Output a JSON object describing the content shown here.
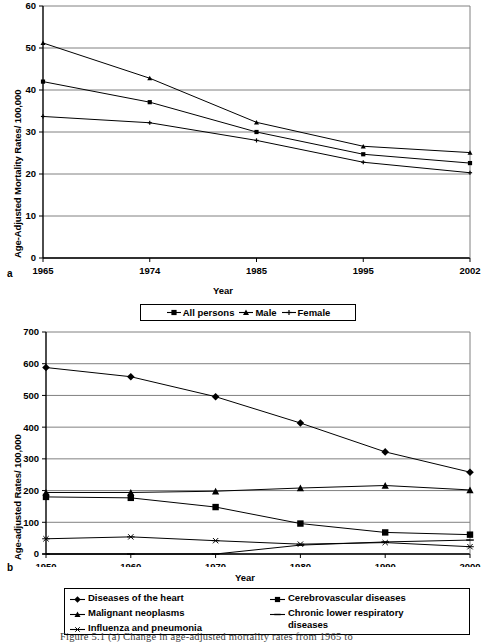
{
  "figure": {
    "caption": "Figure 5.1  (a)  Change in age-adjusted mortality rates from 1965 to",
    "panel_a_label": "a",
    "panel_b_label": "b"
  },
  "chart_data": [
    {
      "id": "panel-a",
      "type": "line",
      "title": "",
      "xlabel": "Year",
      "ylabel": "Age-Adjusted Mortality Rates/ 100,000",
      "categories": [
        "1965",
        "1974",
        "1985",
        "1995",
        "2002"
      ],
      "ylim": [
        0,
        60
      ],
      "yticks": [
        0,
        10,
        20,
        30,
        40,
        50,
        60
      ],
      "grid": true,
      "legend_position": "bottom",
      "series": [
        {
          "name": "All persons",
          "marker": "square",
          "values": [
            42.0,
            37.1,
            30.0,
            24.7,
            22.6
          ]
        },
        {
          "name": "Male",
          "marker": "triangle",
          "values": [
            51.2,
            42.8,
            32.3,
            26.6,
            25.1
          ]
        },
        {
          "name": "Female",
          "marker": "plus",
          "values": [
            33.7,
            32.2,
            28.0,
            22.8,
            20.3
          ]
        }
      ]
    },
    {
      "id": "panel-b",
      "type": "line",
      "title": "",
      "xlabel": "Year",
      "ylabel": "Age-adjusted Rates/ 100,000",
      "categories": [
        "1950",
        "1960",
        "1970",
        "1980",
        "1990",
        "2000"
      ],
      "ylim": [
        0,
        700
      ],
      "yticks": [
        0,
        100,
        200,
        300,
        400,
        500,
        600,
        700
      ],
      "grid": true,
      "legend_position": "bottom",
      "series": [
        {
          "name": "Diseases of the heart",
          "marker": "diamond",
          "values": [
            588,
            559,
            496,
            413,
            322,
            258
          ]
        },
        {
          "name": "Cerebrovascular diseases",
          "marker": "square",
          "values": [
            180,
            177,
            148,
            96,
            68,
            61
          ]
        },
        {
          "name": "Malignant neoplasms",
          "marker": "triangle",
          "values": [
            194,
            194,
            198,
            208,
            216,
            202
          ]
        },
        {
          "name": "Chronic lower respiratory diseases",
          "marker": "dash",
          "values": [
            0,
            0,
            0,
            28,
            38,
            44
          ]
        },
        {
          "name": "Influenza and pneumonia",
          "marker": "asterisk",
          "values": [
            48,
            54,
            42,
            31,
            36,
            23
          ]
        }
      ]
    }
  ],
  "colors": {
    "line": "#000000",
    "grid": "#808080",
    "axis": "#000000",
    "background": "#ffffff"
  }
}
